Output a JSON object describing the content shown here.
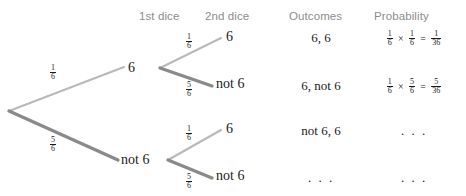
{
  "headers": {
    "first_dice": "1st dice",
    "second_dice": "2nd dice",
    "outcomes": "Outcomes",
    "probability": "Probability"
  },
  "clipped_top_text": "",
  "tree": {
    "root_label": "",
    "level1": [
      {
        "label": "6",
        "prob_numerator": "1",
        "prob_denominator": "6",
        "weight": "thin"
      },
      {
        "label": "not 6",
        "prob_numerator": "5",
        "prob_denominator": "6",
        "weight": "thick"
      }
    ],
    "level2": [
      {
        "label": "6",
        "prob_numerator": "1",
        "prob_denominator": "6",
        "weight": "thin"
      },
      {
        "label": "not 6",
        "prob_numerator": "5",
        "prob_denominator": "6",
        "weight": "thick"
      },
      {
        "label": "6",
        "prob_numerator": "1",
        "prob_denominator": "6",
        "weight": "thin"
      },
      {
        "label": "not 6",
        "prob_numerator": "5",
        "prob_denominator": "6",
        "weight": "thick"
      }
    ]
  },
  "rows": [
    {
      "outcome": "6, 6",
      "probability": {
        "shown": true,
        "a_num": "1",
        "a_den": "6",
        "b_num": "1",
        "b_den": "6",
        "r_num": "1",
        "r_den": "36",
        "times": "×",
        "equals": "="
      }
    },
    {
      "outcome": "6, not 6",
      "probability": {
        "shown": true,
        "a_num": "1",
        "a_den": "6",
        "b_num": "5",
        "b_den": "6",
        "r_num": "5",
        "r_den": "36",
        "times": "×",
        "equals": "="
      }
    },
    {
      "outcome": "not 6, 6",
      "probability": {
        "shown": false,
        "ellipsis": ". . ."
      }
    },
    {
      "outcome_ellipsis": ". . .",
      "probability": {
        "shown": false,
        "ellipsis": ". . ."
      }
    }
  ],
  "colors": {
    "header_text": "#8c8c8c",
    "body_text": "#1b1b1b",
    "branch_thin": "#b9b9b9",
    "branch_thick": "#8a8a8a",
    "background": "#ffffff"
  }
}
